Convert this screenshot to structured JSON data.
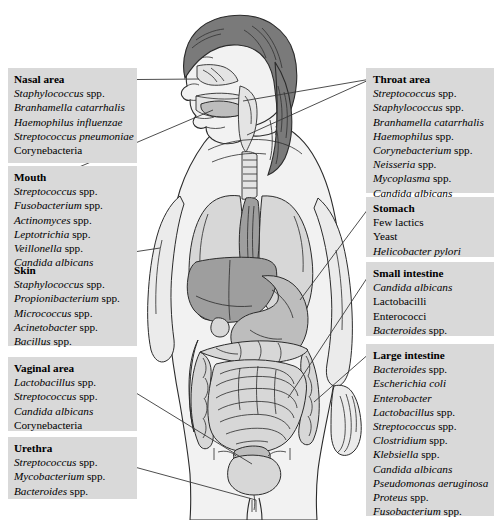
{
  "figure": {
    "alt_name": "human-body-normal-microbiota-diagram",
    "background_color": "#ffffff",
    "panel_color": "#d9d9d9",
    "line_color": "#3a3a3a"
  },
  "left_panel": {
    "sections": [
      {
        "id": "nasal-area",
        "title": "Nasal area",
        "entries": [
          {
            "name": "Staphylococcus",
            "suffix": " spp.",
            "italic": true
          },
          {
            "name": "Branhamella catarrhalis",
            "suffix": "",
            "italic": true
          },
          {
            "name": "Haemophilus influenzae",
            "suffix": "",
            "italic": true
          },
          {
            "name": "Streptococcus pneumoniae",
            "suffix": "",
            "italic": true
          },
          {
            "name": "Corynebacteria",
            "suffix": "",
            "italic": false
          }
        ]
      },
      {
        "id": "mouth",
        "title": "Mouth",
        "entries": [
          {
            "name": "Streptococcus",
            "suffix": " spp.",
            "italic": true
          },
          {
            "name": "Fusobacterium",
            "suffix": " spp.",
            "italic": true
          },
          {
            "name": "Actinomyces",
            "suffix": " spp.",
            "italic": true
          },
          {
            "name": "Leptotrichia",
            "suffix": " spp.",
            "italic": true
          },
          {
            "name": "Veillonella",
            "suffix": " spp.",
            "italic": true
          },
          {
            "name": "Candida albicans",
            "suffix": "",
            "italic": true
          }
        ]
      },
      {
        "id": "skin",
        "title": "Skin",
        "entries": [
          {
            "name": "Staphylococcus",
            "suffix": " spp.",
            "italic": true
          },
          {
            "name": "Propionibacterium",
            "suffix": " spp.",
            "italic": true
          },
          {
            "name": "Micrococcus",
            "suffix": " spp.",
            "italic": true
          },
          {
            "name": "Acinetobacter",
            "suffix": " spp.",
            "italic": true
          },
          {
            "name": "Bacillus",
            "suffix": " spp.",
            "italic": true
          }
        ]
      },
      {
        "id": "vaginal-area",
        "title": "Vaginal area",
        "entries": [
          {
            "name": "Lactobacillus",
            "suffix": " spp.",
            "italic": true
          },
          {
            "name": "Streptococcus",
            "suffix": " spp.",
            "italic": true
          },
          {
            "name": "Candida albicans",
            "suffix": "",
            "italic": true
          },
          {
            "name": "Corynebacteria",
            "suffix": "",
            "italic": false
          }
        ]
      },
      {
        "id": "urethra",
        "title": "Urethra",
        "entries": [
          {
            "name": "Streptococcus",
            "suffix": " spp.",
            "italic": true
          },
          {
            "name": "Mycobacterium",
            "suffix": " spp.",
            "italic": true
          },
          {
            "name": "Bacteroides",
            "suffix": " spp.",
            "italic": true
          }
        ]
      }
    ]
  },
  "right_panel": {
    "sections": [
      {
        "id": "throat-area",
        "title": "Throat area",
        "entries": [
          {
            "name": "Streptococcus",
            "suffix": " spp.",
            "italic": true
          },
          {
            "name": "Staphylococcus",
            "suffix": " spp.",
            "italic": true
          },
          {
            "name": "Branhamella catarrhalis",
            "suffix": "",
            "italic": true
          },
          {
            "name": "Haemophilus",
            "suffix": " spp.",
            "italic": true
          },
          {
            "name": "Corynebacterium",
            "suffix": " spp.",
            "italic": true
          },
          {
            "name": "Neisseria",
            "suffix": " spp.",
            "italic": true
          },
          {
            "name": "Mycoplasma",
            "suffix": " spp.",
            "italic": true
          },
          {
            "name": "Candida albicans",
            "suffix": "",
            "italic": true
          }
        ]
      },
      {
        "id": "stomach",
        "title": "Stomach",
        "entries": [
          {
            "name": "Few lactics",
            "suffix": "",
            "italic": false
          },
          {
            "name": "Yeast",
            "suffix": "",
            "italic": false
          },
          {
            "name": "Helicobacter pylori",
            "suffix": "",
            "italic": true
          }
        ]
      },
      {
        "id": "small-intestine",
        "title": "Small intestine",
        "entries": [
          {
            "name": "Candida albicans",
            "suffix": "",
            "italic": true
          },
          {
            "name": "Lactobacilli",
            "suffix": "",
            "italic": false
          },
          {
            "name": "Enterococci",
            "suffix": "",
            "italic": false
          },
          {
            "name": "Bacteroides",
            "suffix": " spp.",
            "italic": true
          }
        ]
      },
      {
        "id": "large-intestine",
        "title": "Large intestine",
        "entries": [
          {
            "name": "Bacteroides",
            "suffix": " spp.",
            "italic": true
          },
          {
            "name": "Escherichia coli",
            "suffix": "",
            "italic": true
          },
          {
            "name": "Enterobacter",
            "suffix": "",
            "italic": true
          },
          {
            "name": "Lactobacillus",
            "suffix": " spp.",
            "italic": true
          },
          {
            "name": "Streptococcus",
            "suffix": " spp.",
            "italic": true
          },
          {
            "name": "Clostridium",
            "suffix": " spp.",
            "italic": true
          },
          {
            "name": "Klebsiella",
            "suffix": " spp.",
            "italic": true
          },
          {
            "name": "Candida albicans",
            "suffix": "",
            "italic": true
          },
          {
            "name": "Pseudomonas aeruginosa",
            "suffix": "",
            "italic": true
          },
          {
            "name": "Proteus",
            "suffix": " spp.",
            "italic": true
          },
          {
            "name": "Fusobacterium",
            "suffix": " spp.",
            "italic": true
          }
        ]
      }
    ]
  },
  "anatomy_parts": [
    "head-profile",
    "hair",
    "nasal-cavity",
    "oral-cavity",
    "tongue",
    "pharynx",
    "trachea",
    "esophagus",
    "lung-left",
    "lung-right",
    "liver",
    "stomach",
    "small-intestine",
    "large-intestine",
    "bladder",
    "uterus",
    "torso-outline",
    "arm-left",
    "arm-right",
    "hand-right"
  ]
}
